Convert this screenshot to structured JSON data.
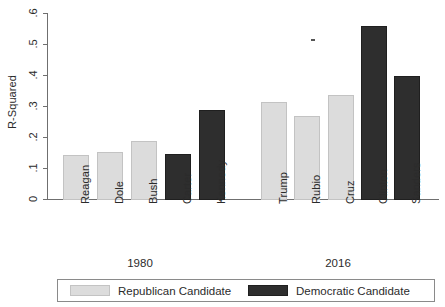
{
  "chart_data": {
    "type": "bar",
    "title": "",
    "xlabel": "",
    "ylabel": "R-Squared",
    "ylim": [
      0,
      0.62
    ],
    "ytick_labels": [
      "0",
      ".1",
      ".2",
      ".3",
      ".4",
      ".5",
      ".6"
    ],
    "ytick_values": [
      0,
      0.1,
      0.2,
      0.3,
      0.4,
      0.5,
      0.6
    ],
    "grid": false,
    "legend_position": "bottom",
    "categories": [
      "Reagan",
      "Dole",
      "Bush",
      "Carter",
      "Kennedy",
      "Trump",
      "Rubio",
      "Cruz",
      "Clinton",
      "Sanders"
    ],
    "values": [
      0.145,
      0.155,
      0.19,
      0.15,
      0.29,
      0.315,
      0.27,
      0.34,
      0.56,
      0.4
    ],
    "party": [
      "Republican",
      "Republican",
      "Republican",
      "Democratic",
      "Democratic",
      "Republican",
      "Republican",
      "Republican",
      "Democratic",
      "Democratic"
    ],
    "groups": [
      {
        "label": "1980",
        "categories": [
          "Reagan",
          "Dole",
          "Bush",
          "Carter",
          "Kennedy"
        ]
      },
      {
        "label": "2016",
        "categories": [
          "Trump",
          "Rubio",
          "Cruz",
          "Clinton",
          "Sanders"
        ]
      }
    ],
    "legend": [
      {
        "name": "Republican Candidate",
        "color": "#dcdcdc"
      },
      {
        "name": "Democratic Candidate",
        "color": "#2e2e2e"
      }
    ],
    "colors": {
      "republican": "#dcdcdc",
      "democratic": "#2e2e2e",
      "axis": "#6f6f6f",
      "text": "#2b2b2b"
    }
  },
  "bars": [
    {
      "label": "Reagan",
      "value": 0.145,
      "party": "Republican"
    },
    {
      "label": "Dole",
      "value": 0.155,
      "party": "Republican"
    },
    {
      "label": "Bush",
      "value": 0.19,
      "party": "Republican"
    },
    {
      "label": "Carter",
      "value": 0.15,
      "party": "Democratic"
    },
    {
      "label": "Kennedy",
      "value": 0.29,
      "party": "Democratic"
    },
    {
      "label": "Trump",
      "value": 0.315,
      "party": "Republican"
    },
    {
      "label": "Rubio",
      "value": 0.27,
      "party": "Republican"
    },
    {
      "label": "Cruz",
      "value": 0.34,
      "party": "Republican"
    },
    {
      "label": "Clinton",
      "value": 0.56,
      "party": "Democratic"
    },
    {
      "label": "Sanders",
      "value": 0.4,
      "party": "Democratic"
    }
  ],
  "axis": {
    "y_title": "R-Squared",
    "ticks": [
      ".6",
      ".5",
      ".4",
      ".3",
      ".2",
      ".1",
      "0"
    ]
  },
  "groups": {
    "first": "1980",
    "second": "2016"
  },
  "legend": {
    "republican": "Republican Candidate",
    "democratic": "Democratic Candidate"
  }
}
